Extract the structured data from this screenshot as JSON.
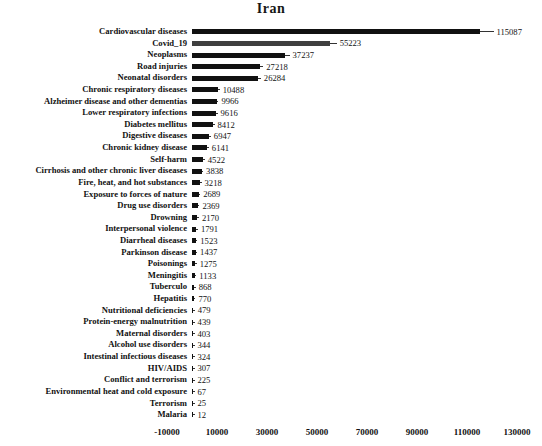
{
  "chart_data": {
    "type": "bar",
    "orientation": "horizontal",
    "title": "Iran",
    "categories": [
      "Cardiovascular diseases",
      "Covid_19",
      "Neoplasms",
      "Road injuries",
      "Neonatal disorders",
      "Chronic respiratory diseases",
      "Alzheimer disease and other dementias",
      "Lower respiratory infections",
      "Diabetes mellitus",
      "Digestive diseases",
      "Chronic kidney disease",
      "Self-harm",
      "Cirrhosis and other chronic liver diseases",
      "Fire, heat, and hot substances",
      "Exposure to forces of nature",
      "Drug use disorders",
      "Drowning",
      "Interpersonal violence",
      "Diarrheal diseases",
      "Parkinson disease",
      "Poisonings",
      "Meningitis",
      "Tuberculo",
      "Hepatitis",
      "Nutritional deficiencies",
      "Protein-energy malnutrition",
      "Maternal disorders",
      "Alcohol use disorders",
      "Intestinal infectious diseases",
      "HIV/AIDS",
      "Conflict and terrorism",
      "Environmental heat and cold exposure",
      "Terrorism",
      "Malaria"
    ],
    "values": [
      115087,
      55223,
      37237,
      27218,
      26284,
      10488,
      9966,
      9616,
      8412,
      6947,
      6141,
      4522,
      3838,
      3218,
      2689,
      2369,
      2170,
      1791,
      1523,
      1437,
      1275,
      1133,
      868,
      770,
      479,
      439,
      403,
      344,
      324,
      307,
      225,
      67,
      25,
      12
    ],
    "value_labels_shown": true,
    "xlabel": "",
    "ylabel": "",
    "xlim": [
      -10000,
      135000
    ],
    "x_ticks": [
      -10000,
      10000,
      30000,
      50000,
      70000,
      90000,
      110000,
      130000
    ],
    "x_tick_labels": [
      "-10000",
      "10000",
      "30000",
      "50000",
      "70000",
      "90000",
      "110000",
      "130000"
    ],
    "grid": false,
    "legend": false,
    "bar_color": "#111111",
    "highlight_category": "Covid_19",
    "highlight_color": "#3f3f3f",
    "background_color": "#ffffff"
  }
}
